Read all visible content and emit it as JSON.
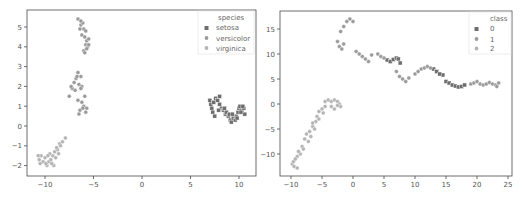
{
  "chart_data": [
    {
      "type": "scatter",
      "title": "",
      "xlabel": "",
      "ylabel": "",
      "xlim": [
        -11.5,
        12
      ],
      "ylim": [
        -2.5,
        5.8
      ],
      "xticks": [
        -10,
        -5,
        0,
        5,
        10
      ],
      "yticks": [
        -2,
        -1,
        0,
        1,
        2,
        3,
        4,
        5
      ],
      "grid": false,
      "legend": {
        "title": "species",
        "position": "upper right",
        "entries": [
          "setosa",
          "versicolor",
          "virginica"
        ]
      },
      "series": [
        {
          "name": "setosa",
          "marker": "square",
          "color": "#6e6e6e",
          "points": [
            [
              7.0,
              1.3
            ],
            [
              7.1,
              1.1
            ],
            [
              7.2,
              0.9
            ],
            [
              7.3,
              0.7
            ],
            [
              7.5,
              0.5
            ],
            [
              7.6,
              1.4
            ],
            [
              7.8,
              1.3
            ],
            [
              8.0,
              1.5
            ],
            [
              8.0,
              1.1
            ],
            [
              8.2,
              0.9
            ],
            [
              8.4,
              0.8
            ],
            [
              8.6,
              0.6
            ],
            [
              8.7,
              0.7
            ],
            [
              8.9,
              0.5
            ],
            [
              9.0,
              0.6
            ],
            [
              9.1,
              0.3
            ],
            [
              9.2,
              0.2
            ],
            [
              9.4,
              0.4
            ],
            [
              9.6,
              0.3
            ],
            [
              9.7,
              0.5
            ],
            [
              9.9,
              0.7
            ],
            [
              10.0,
              0.9
            ],
            [
              10.1,
              1.0
            ],
            [
              10.3,
              0.8
            ],
            [
              10.5,
              0.9
            ],
            [
              10.6,
              0.6
            ],
            [
              10.4,
              1.0
            ],
            [
              9.8,
              0.4
            ],
            [
              9.3,
              0.6
            ],
            [
              8.5,
              0.9
            ],
            [
              7.4,
              1.2
            ],
            [
              7.9,
              0.8
            ],
            [
              10.2,
              0.7
            ]
          ]
        },
        {
          "name": "versicolor",
          "marker": "circle",
          "color": "#9a9a9a",
          "points": [
            [
              -6.6,
              5.4
            ],
            [
              -6.3,
              5.1
            ],
            [
              -6.1,
              5.2
            ],
            [
              -6.0,
              4.9
            ],
            [
              -5.8,
              4.8
            ],
            [
              -6.2,
              4.6
            ],
            [
              -5.9,
              4.5
            ],
            [
              -5.7,
              4.3
            ],
            [
              -5.5,
              4.4
            ],
            [
              -5.8,
              4.1
            ],
            [
              -5.6,
              4.0
            ],
            [
              -6.0,
              3.8
            ],
            [
              -5.7,
              3.9
            ],
            [
              -6.4,
              4.9
            ],
            [
              -5.9,
              3.7
            ],
            [
              -5.5,
              4.1
            ],
            [
              -6.3,
              5.3
            ],
            [
              -6.6,
              2.7
            ],
            [
              -6.3,
              2.5
            ],
            [
              -6.8,
              2.4
            ],
            [
              -7.0,
              2.2
            ],
            [
              -6.5,
              2.1
            ],
            [
              -7.2,
              1.9
            ],
            [
              -6.9,
              1.8
            ],
            [
              -6.2,
              2.0
            ],
            [
              -7.5,
              1.5
            ],
            [
              -6.6,
              1.3
            ],
            [
              -6.2,
              1.2
            ],
            [
              -5.9,
              1.5
            ],
            [
              -6.0,
              1.0
            ],
            [
              -5.7,
              0.9
            ],
            [
              -6.4,
              0.8
            ],
            [
              -6.5,
              0.6
            ],
            [
              -5.8,
              0.7
            ],
            [
              -6.1,
              0.9
            ],
            [
              -7.3,
              2.0
            ],
            [
              -6.7,
              2.5
            ],
            [
              -6.3,
              1.9
            ]
          ]
        },
        {
          "name": "virginica",
          "marker": "circle",
          "color": "#b4b4b4",
          "points": [
            [
              -10.6,
              -1.7
            ],
            [
              -10.4,
              -1.5
            ],
            [
              -10.2,
              -1.8
            ],
            [
              -10.0,
              -1.6
            ],
            [
              -9.8,
              -2.0
            ],
            [
              -9.6,
              -1.8
            ],
            [
              -9.4,
              -1.7
            ],
            [
              -9.2,
              -1.5
            ],
            [
              -9.0,
              -1.3
            ],
            [
              -8.9,
              -1.6
            ],
            [
              -8.7,
              -1.2
            ],
            [
              -8.5,
              -0.9
            ],
            [
              -8.2,
              -0.8
            ],
            [
              -7.9,
              -0.6
            ],
            [
              -9.1,
              -2.0
            ],
            [
              -9.3,
              -1.9
            ],
            [
              -10.5,
              -1.9
            ],
            [
              -10.7,
              -1.5
            ],
            [
              -8.8,
              -1.1
            ],
            [
              -9.5,
              -1.4
            ],
            [
              -9.7,
              -1.5
            ],
            [
              -9.9,
              -1.9
            ],
            [
              -8.6,
              -1.4
            ],
            [
              -8.4,
              -1.0
            ]
          ]
        }
      ]
    },
    {
      "type": "scatter",
      "title": "",
      "xlabel": "",
      "ylabel": "",
      "xlim": [
        -11,
        25.5
      ],
      "ylim": [
        -14.5,
        18.5
      ],
      "xticks": [
        -10,
        -5,
        0,
        5,
        10,
        15,
        20,
        25
      ],
      "yticks": [
        -10,
        -5,
        0,
        5,
        10,
        15
      ],
      "grid": false,
      "legend": {
        "title": "class",
        "position": "upper right",
        "entries": [
          "0",
          "1",
          "2"
        ]
      },
      "series": [
        {
          "name": "0",
          "marker": "square",
          "color": "#6e6e6e",
          "points": [
            [
              5.5,
              8.8
            ],
            [
              6.0,
              8.5
            ],
            [
              6.5,
              8.9
            ],
            [
              7.0,
              9.2
            ],
            [
              7.3,
              9.0
            ],
            [
              7.6,
              8.2
            ],
            [
              14.5,
              5.8
            ],
            [
              15.0,
              4.5
            ],
            [
              15.5,
              4.2
            ],
            [
              16.0,
              3.8
            ],
            [
              16.5,
              3.6
            ],
            [
              17.0,
              3.4
            ],
            [
              17.5,
              3.5
            ],
            [
              18.0,
              3.8
            ],
            [
              13.0,
              7.0
            ],
            [
              13.5,
              6.5
            ],
            [
              14.0,
              6.0
            ]
          ]
        },
        {
          "name": "1",
          "marker": "circle",
          "color": "#9a9a9a",
          "points": [
            [
              -1.5,
              15.5
            ],
            [
              -1.0,
              16.5
            ],
            [
              -0.5,
              17.0
            ],
            [
              0.0,
              16.5
            ],
            [
              -2.0,
              14.5
            ],
            [
              -2.5,
              12.5
            ],
            [
              -2.2,
              11.5
            ],
            [
              -1.8,
              11.0
            ],
            [
              -1.5,
              12.0
            ],
            [
              0.5,
              10.5
            ],
            [
              1.0,
              10.0
            ],
            [
              1.5,
              9.5
            ],
            [
              2.0,
              9.0
            ],
            [
              2.5,
              8.5
            ],
            [
              3.0,
              9.8
            ],
            [
              4.0,
              10.0
            ],
            [
              4.5,
              9.5
            ],
            [
              5.0,
              9.2
            ],
            [
              7.0,
              6.5
            ],
            [
              7.5,
              5.5
            ],
            [
              8.0,
              5.0
            ],
            [
              8.5,
              4.5
            ],
            [
              9.0,
              5.2
            ],
            [
              10.0,
              6.0
            ],
            [
              10.5,
              6.5
            ],
            [
              11.0,
              7.0
            ],
            [
              11.5,
              7.2
            ],
            [
              12.0,
              7.5
            ],
            [
              12.5,
              7.2
            ],
            [
              19.0,
              4.0
            ],
            [
              19.5,
              4.2
            ],
            [
              20.0,
              4.5
            ],
            [
              20.5,
              4.0
            ],
            [
              21.0,
              3.8
            ],
            [
              21.5,
              4.0
            ],
            [
              22.0,
              4.3
            ],
            [
              22.5,
              4.0
            ],
            [
              23.0,
              3.8
            ],
            [
              23.5,
              4.2
            ],
            [
              23.2,
              3.5
            ]
          ]
        },
        {
          "name": "2",
          "marker": "circle",
          "color": "#b4b4b4",
          "points": [
            [
              -9.8,
              -12.0
            ],
            [
              -9.5,
              -12.5
            ],
            [
              -9.0,
              -12.8
            ],
            [
              -9.6,
              -11.5
            ],
            [
              -9.0,
              -10.5
            ],
            [
              -8.5,
              -10.0
            ],
            [
              -8.8,
              -9.5
            ],
            [
              -8.2,
              -8.5
            ],
            [
              -7.8,
              -7.0
            ],
            [
              -7.5,
              -6.0
            ],
            [
              -7.0,
              -5.5
            ],
            [
              -6.8,
              -6.5
            ],
            [
              -6.5,
              -4.5
            ],
            [
              -6.0,
              -3.5
            ],
            [
              -5.8,
              -2.5
            ],
            [
              -5.5,
              -1.5
            ],
            [
              -5.0,
              -1.0
            ],
            [
              -4.5,
              -0.5
            ],
            [
              -4.5,
              0.5
            ],
            [
              -4.0,
              0.8
            ],
            [
              -3.5,
              0.5
            ],
            [
              -3.0,
              0.8
            ],
            [
              -2.5,
              0.5
            ],
            [
              -2.2,
              0.0
            ],
            [
              -2.0,
              -0.5
            ],
            [
              -3.0,
              -1.0
            ],
            [
              -3.5,
              -0.5
            ],
            [
              -5.5,
              -3.0
            ],
            [
              -6.2,
              -5.0
            ],
            [
              -7.2,
              -7.5
            ],
            [
              -8.0,
              -9.0
            ],
            [
              -9.3,
              -11.0
            ],
            [
              -4.8,
              -1.8
            ],
            [
              -6.5,
              -3.8
            ],
            [
              -2.5,
              -0.3
            ]
          ]
        }
      ]
    }
  ],
  "legends": {
    "left": {
      "title": "species",
      "items": [
        "setosa",
        "versicolor",
        "virginica"
      ]
    },
    "right": {
      "title": "class",
      "items": [
        "0",
        "1",
        "2"
      ]
    }
  }
}
